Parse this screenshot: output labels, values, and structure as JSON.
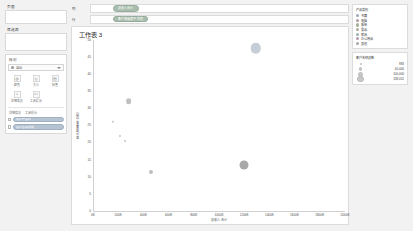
{
  "sidebar": {
    "pages_label": "页面",
    "filters_label": "筛选器",
    "marks_label": "标记",
    "mark_type": "自动",
    "mark_buttons": [
      {
        "icon": "color-icon",
        "glyph": "◍",
        "label": "颜色"
      },
      {
        "icon": "size-icon",
        "glyph": "◎",
        "label": "大小"
      },
      {
        "icon": "label-icon",
        "glyph": "▤",
        "label": "标签"
      },
      {
        "icon": "detail-icon",
        "glyph": "▵",
        "label": "详细信息"
      },
      {
        "icon": "tooltip-icon",
        "glyph": "▭",
        "label": "工具提示"
      }
    ],
    "pill_columns": [
      "详细信息",
      "工具提示"
    ],
    "pills": [
      {
        "label": "用户产品线",
        "color": "blue"
      },
      {
        "label": "客户名称总数",
        "color": "blue"
      }
    ]
  },
  "shelves": [
    {
      "name": "列",
      "pill": "总收入合计"
    },
    {
      "name": "行",
      "pill": "客户满意度平均值"
    }
  ],
  "chart_data": {
    "type": "scatter",
    "title": "工作表 3",
    "xlabel": "总收入合计",
    "ylabel": "客户满意度平均值",
    "xlim": [
      0,
      2000
    ],
    "ylim": [
      0,
      50
    ],
    "xticks": [
      "0K",
      "200K",
      "400K",
      "600K",
      "800K",
      "1000K",
      "1200K",
      "1400K",
      "1600K",
      "1800K",
      "2000K"
    ],
    "xtickvals": [
      0,
      200,
      400,
      600,
      800,
      1000,
      1200,
      1400,
      1600,
      1800,
      2000
    ],
    "yticks": [
      0,
      5,
      10,
      15,
      20,
      25,
      30,
      35,
      40,
      45,
      50
    ],
    "grid": false,
    "legend_position": "right",
    "points": [
      {
        "x": 1290,
        "y": 47.5,
        "size": 138012,
        "color": "#c5cdd6",
        "label": "办公用品"
      },
      {
        "x": 275,
        "y": 32.0,
        "size": 40000,
        "color": "#c0c0c0",
        "label": "电脑"
      },
      {
        "x": 150,
        "y": 26.0,
        "size": 6000,
        "color": "#c4c4c4",
        "label": "家具"
      },
      {
        "x": 205,
        "y": 22.0,
        "size": 5000,
        "color": "#c4c4c4",
        "label": "书籍"
      },
      {
        "x": 250,
        "y": 20.5,
        "size": 4500,
        "color": "#c4c4c4",
        "label": "食品"
      },
      {
        "x": 455,
        "y": 11.5,
        "size": 20000,
        "color": "#bdbdbd",
        "label": "服装"
      },
      {
        "x": 1195,
        "y": 13.5,
        "size": 100000,
        "color": "#a9a9a9",
        "label": "其他"
      }
    ]
  },
  "legend": {
    "color_title": "产品类别",
    "color_items": [
      {
        "label": "书籍",
        "color": "#9aa8b6"
      },
      {
        "label": "电脑",
        "color": "#b39aa0"
      },
      {
        "label": "服装",
        "color": "#a6b39a"
      },
      {
        "label": "食品",
        "color": "#b3ab9a"
      },
      {
        "label": "家具",
        "color": "#9ab3b0"
      },
      {
        "label": "办公用品",
        "color": "#b39ab0"
      },
      {
        "label": "其他",
        "color": "#a8a8a8"
      }
    ],
    "size_title": "客户名称总数",
    "size_items": [
      {
        "value": "983",
        "d": 1.8
      },
      {
        "value": "40,000",
        "d": 3.4
      },
      {
        "value": "100,000",
        "d": 5.0
      },
      {
        "value": "138,012",
        "d": 6.4
      }
    ]
  },
  "colors": {
    "canvas": "#ffffff",
    "app_bg": "#f2f2f2",
    "pill_blue": "#b6c3d2",
    "pill_green": "#a9bdae",
    "axis": "#d0d0d0",
    "text": "#3c3c3c"
  }
}
